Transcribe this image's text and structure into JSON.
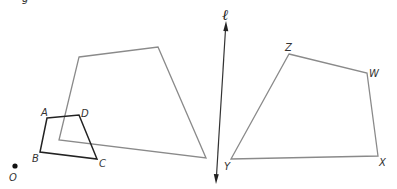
{
  "diagram": {
    "title_fragment": "g",
    "center_point": {
      "label": "O",
      "x": 15,
      "y": 166
    },
    "line": {
      "label": "ℓ",
      "x1": 226,
      "y1": 22,
      "x2": 216,
      "y2": 183
    },
    "preimage": {
      "name": "ABCD",
      "vertices": [
        {
          "label": "A",
          "x": 47,
          "y": 118
        },
        {
          "label": "D",
          "x": 79,
          "y": 115
        },
        {
          "label": "C",
          "x": 97,
          "y": 159
        },
        {
          "label": "B",
          "x": 40,
          "y": 152
        }
      ],
      "color": "#222222"
    },
    "dilation_image": {
      "vertices": [
        {
          "x": 79,
          "y": 57
        },
        {
          "x": 158,
          "y": 47
        },
        {
          "x": 206,
          "y": 158
        },
        {
          "x": 59,
          "y": 140
        }
      ],
      "color": "#8a8a8a"
    },
    "reflection_image": {
      "name": "WXYZ",
      "vertices": [
        {
          "label": "Z",
          "x": 289,
          "y": 54
        },
        {
          "label": "W",
          "x": 367,
          "y": 73
        },
        {
          "label": "X",
          "x": 378,
          "y": 156
        },
        {
          "label": "Y",
          "x": 231,
          "y": 159
        }
      ],
      "color": "#8a8a8a"
    },
    "labels": {
      "A": "A",
      "B": "B",
      "C": "C",
      "D": "D",
      "O": "O",
      "W": "W",
      "X": "X",
      "Y": "Y",
      "Z": "Z",
      "l": "ℓ"
    }
  }
}
